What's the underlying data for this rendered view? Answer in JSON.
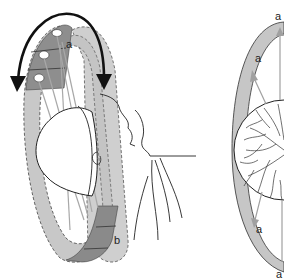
{
  "figure": {
    "left_panel": {
      "description": "Ring perimeter around patient head with rotation arrows",
      "labels": {
        "top": "a",
        "bottom": "b"
      },
      "rotation_arrow": "double-headed curved arrow"
    },
    "right_panel": {
      "description": "Ring cross-section with retinal vessel pattern",
      "labels": {
        "top_right": "a",
        "upper_left": "a",
        "lower_left": "a",
        "bottom": "a"
      }
    }
  },
  "colors": {
    "ring_light": "#c8c8c8",
    "ring_dark": "#8f8f8f",
    "line": "#222222",
    "ray": "#a0a0a0"
  }
}
